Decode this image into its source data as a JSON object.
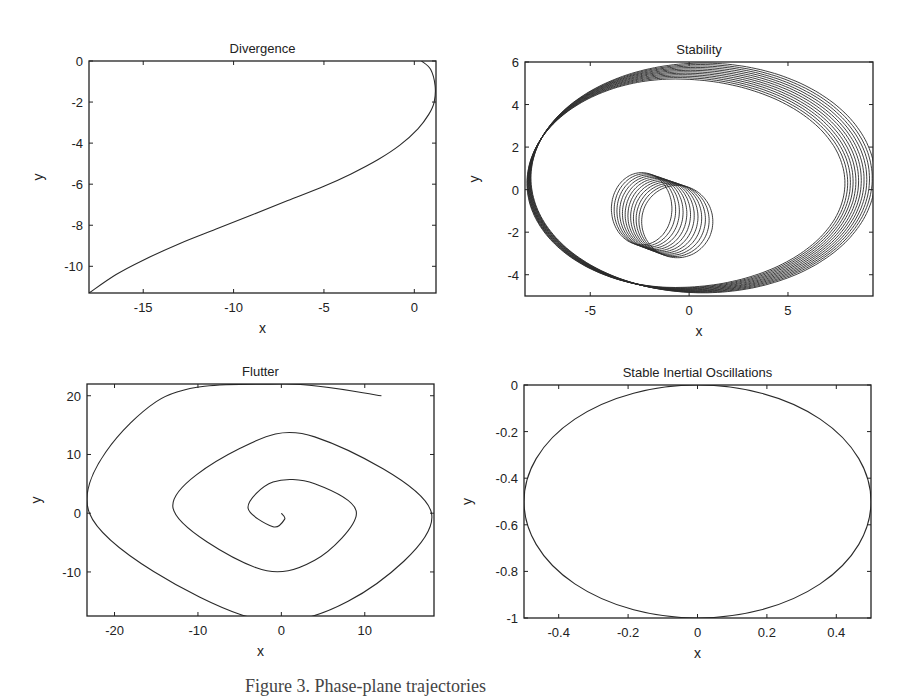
{
  "figure": {
    "caption": "Figure 3. Phase-plane trajectories"
  },
  "chart_data": [
    {
      "type": "line",
      "title": "Divergence",
      "xlabel": "x",
      "ylabel": "y",
      "xlim": [
        -18,
        1.2
      ],
      "ylim": [
        -11.3,
        0
      ],
      "xticks": [
        -15,
        -10,
        -5,
        0
      ],
      "yticks": [
        0,
        -2,
        -4,
        -6,
        -8,
        -10
      ],
      "grid": false,
      "series": [
        {
          "name": "trajectory",
          "x": [
            0.4,
            0.9,
            1.15,
            1.1,
            0.8,
            0.2,
            -0.8,
            -2.0,
            -3.5,
            -5.0,
            -7.0,
            -9.0,
            -11.0,
            -13.0,
            -15.0,
            -16.5,
            -18.0
          ],
          "y": [
            0,
            -0.4,
            -1.2,
            -2.0,
            -2.6,
            -3.3,
            -4.1,
            -4.8,
            -5.5,
            -6.1,
            -6.8,
            -7.5,
            -8.2,
            -8.9,
            -9.7,
            -10.4,
            -11.3
          ]
        }
      ]
    },
    {
      "type": "line",
      "title": "Stability",
      "xlabel": "x",
      "ylabel": "y",
      "xlim": [
        -8.3,
        9.3
      ],
      "ylim": [
        -5,
        6
      ],
      "xticks": [
        -5,
        0,
        5
      ],
      "yticks": [
        6,
        4,
        2,
        0,
        -2,
        -4
      ],
      "grid": false,
      "description": "Family of ~12 overlapping looped orbits; outer ellipse spans x≈-8.2..9.2, y≈-5..5.9; inner loops near (-2,-1) with radius ~1.7",
      "series": [
        {
          "name": "outer orbit (approx.)",
          "center": [
            0.5,
            0.5
          ],
          "radius_x": 8.7,
          "radius_y": 5.4
        },
        {
          "name": "inner loop (approx.)",
          "center": [
            -1.5,
            -1.0
          ],
          "radius_x": 1.8,
          "radius_y": 1.7
        }
      ],
      "loop_count": 12
    },
    {
      "type": "line",
      "title": "Flutter",
      "xlabel": "x",
      "ylabel": "y",
      "xlim": [
        -23.3,
        18.3
      ],
      "ylim": [
        -17.5,
        22
      ],
      "xticks": [
        -20,
        -10,
        0,
        10
      ],
      "yticks": [
        20,
        10,
        0,
        -10
      ],
      "grid": false,
      "description": "Outward spiral from (0,0) ending near (12,20)",
      "series": [
        {
          "name": "spiral",
          "x": [
            0,
            0.4,
            -1,
            -4,
            -1,
            4,
            9,
            4,
            -3,
            -13,
            -5,
            4,
            18,
            8,
            -5,
            -23,
            -15,
            0,
            12
          ],
          "y": [
            0,
            -1,
            -2.3,
            1,
            5.3,
            5,
            0,
            -8,
            -9.3,
            1,
            11,
            13,
            0,
            -15,
            -17.2,
            0,
            19,
            22,
            20
          ]
        }
      ]
    },
    {
      "type": "line",
      "title": "Stable Inertial Oscillations",
      "xlabel": "x",
      "ylabel": "y",
      "xlim": [
        -0.5,
        0.5
      ],
      "ylim": [
        -1,
        0
      ],
      "xticks": [
        -0.4,
        -0.2,
        0,
        0.2,
        0.4
      ],
      "yticks": [
        0,
        -0.2,
        -0.4,
        -0.6,
        -0.8,
        -1
      ],
      "grid": false,
      "description": "Closed ellipse centered at (0,-0.5), semi-axes 0.5 (x) and 0.5 (y)",
      "series": [
        {
          "name": "ellipse",
          "center": [
            0,
            -0.5
          ],
          "radius_x": 0.5,
          "radius_y": 0.5
        }
      ]
    }
  ]
}
